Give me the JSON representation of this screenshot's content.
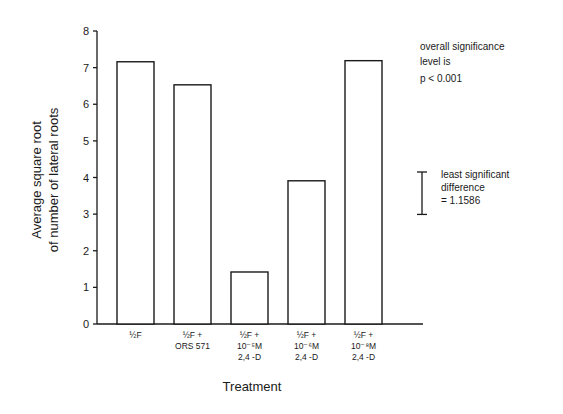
{
  "chart_data": {
    "type": "bar",
    "title": "",
    "xlabel": "Treatment",
    "ylabel": "Average square root of number of lateral roots",
    "ylabel_lines": [
      "Average square root",
      "of number of lateral roots"
    ],
    "ylim": [
      0,
      8
    ],
    "yticks": [
      0,
      1,
      2,
      3,
      4,
      5,
      6,
      7,
      8
    ],
    "grid": false,
    "legend": null,
    "categories": [
      "½F",
      "½F + ORS 571",
      "½F + 10⁻⁵M 2,4-D",
      "½F + 10⁻⁶M 2,4-D",
      "½F + 10⁻⁸M 2,4-D"
    ],
    "category_lines": [
      [
        "½F"
      ],
      [
        "½F +",
        "ORS 571"
      ],
      [
        "½F +",
        "10⁻⁵M",
        "2,4 -D"
      ],
      [
        "½F +",
        "10⁻⁶M",
        "2,4 -D"
      ],
      [
        "½F +",
        "10⁻⁸M",
        "2,4 -D"
      ]
    ],
    "values": [
      7.16,
      6.53,
      1.42,
      3.91,
      7.19
    ],
    "annotations": {
      "significance": [
        "overall significance",
        "level is",
        "p < 0.001"
      ],
      "lsd": {
        "lines": [
          "least significant",
          "difference",
          "= 1.1586"
        ],
        "value": 1.1586
      }
    },
    "bar_fill": "#ffffff",
    "bar_stroke": "#1a1a1a"
  }
}
